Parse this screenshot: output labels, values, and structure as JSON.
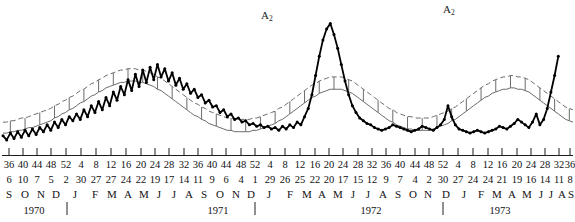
{
  "figure": {
    "title": "",
    "annotations": [
      {
        "name": "a2-peak-1",
        "text": "A",
        "sub": "2",
        "x": 261,
        "y": 10
      },
      {
        "name": "a2-peak-2",
        "text": "A",
        "sub": "2",
        "x": 443,
        "y": 4
      }
    ]
  },
  "chart_data": {
    "type": "line",
    "title": "",
    "xlabel": "",
    "ylabel": "",
    "grid": false,
    "legend": "none",
    "xlim": [
      0,
      157
    ],
    "ylim": [
      0,
      100
    ],
    "series": [
      {
        "name": "observed",
        "style": "solid-heavy-with-markers",
        "color": "#000000",
        "values": [
          14,
          11,
          16,
          12,
          17,
          13,
          18,
          14,
          19,
          15,
          20,
          17,
          22,
          18,
          24,
          20,
          26,
          22,
          28,
          25,
          30,
          26,
          33,
          28,
          36,
          31,
          39,
          33,
          42,
          36,
          46,
          40,
          50,
          44,
          55,
          47,
          59,
          50,
          62,
          53,
          64,
          55,
          66,
          57,
          63,
          54,
          60,
          51,
          56,
          48,
          52,
          45,
          48,
          42,
          44,
          38,
          40,
          35,
          36,
          31,
          33,
          28,
          30,
          26,
          27,
          24,
          25,
          22,
          23,
          21,
          22,
          20,
          21,
          19,
          20,
          18,
          21,
          19,
          22,
          20,
          24,
          22,
          28,
          34,
          44,
          58,
          72,
          84,
          92,
          96,
          88,
          78,
          66,
          54,
          44,
          36,
          31,
          27,
          25,
          23,
          22,
          20,
          19,
          18,
          19,
          20,
          22,
          21,
          20,
          19,
          18,
          17,
          18,
          19,
          21,
          20,
          19,
          18,
          20,
          22,
          26,
          36,
          28,
          22,
          19,
          18,
          17,
          16,
          17,
          18,
          17,
          16,
          17,
          18,
          19,
          21,
          20,
          19,
          21,
          23,
          26,
          24,
          22,
          20,
          24,
          30,
          22,
          26,
          34,
          46,
          58,
          72,
          88,
          70,
          62,
          66
        ]
      },
      {
        "name": "expected-upper",
        "style": "solid-thin",
        "color": "#6b6b6b",
        "values": [
          24,
          24,
          25,
          25,
          26,
          27,
          27,
          28,
          29,
          30,
          31,
          32,
          33,
          34,
          36,
          37,
          39,
          40,
          42,
          43,
          45,
          47,
          48,
          50,
          52,
          53,
          55,
          56,
          58,
          59,
          60,
          61,
          62,
          62,
          63,
          63,
          63,
          62,
          62,
          61,
          60,
          59,
          57,
          56,
          54,
          52,
          50,
          48,
          46,
          44,
          42,
          40,
          38,
          37,
          35,
          34,
          32,
          31,
          30,
          29,
          28,
          27,
          27,
          26,
          26,
          26,
          26,
          26,
          27,
          27,
          28,
          29,
          30,
          31,
          32,
          34,
          35,
          37,
          39,
          41,
          43,
          45,
          47,
          49,
          51,
          52,
          54,
          55,
          56,
          57,
          57,
          57,
          57,
          56,
          55,
          54,
          52,
          50,
          48,
          46,
          44,
          42,
          40,
          38,
          36,
          34,
          33,
          31,
          30,
          29,
          28,
          28,
          27,
          27,
          27,
          27,
          27,
          28,
          29,
          30,
          31,
          32,
          34,
          35,
          37,
          39,
          41,
          43,
          45,
          47,
          49,
          51,
          52,
          54,
          55,
          56,
          57,
          57,
          58,
          58,
          57,
          57,
          56,
          55,
          53,
          51,
          49,
          47,
          45,
          43,
          41,
          39,
          37,
          35,
          34,
          33
        ]
      },
      {
        "name": "expected-lower",
        "style": "solid-thin",
        "color": "#6b6b6b",
        "values": [
          16,
          16,
          17,
          17,
          18,
          18,
          19,
          20,
          20,
          21,
          22,
          23,
          24,
          25,
          27,
          28,
          30,
          31,
          33,
          34,
          36,
          38,
          39,
          41,
          43,
          44,
          46,
          47,
          49,
          50,
          51,
          52,
          53,
          53,
          54,
          54,
          54,
          53,
          53,
          52,
          51,
          50,
          48,
          47,
          45,
          43,
          41,
          39,
          37,
          35,
          33,
          31,
          29,
          28,
          26,
          25,
          23,
          22,
          21,
          20,
          19,
          18,
          18,
          17,
          17,
          17,
          17,
          17,
          18,
          18,
          19,
          20,
          21,
          22,
          23,
          25,
          26,
          28,
          30,
          32,
          34,
          36,
          38,
          40,
          42,
          43,
          45,
          46,
          47,
          48,
          48,
          48,
          48,
          47,
          46,
          45,
          43,
          41,
          39,
          37,
          35,
          33,
          31,
          29,
          27,
          25,
          24,
          22,
          21,
          20,
          19,
          19,
          18,
          18,
          18,
          18,
          18,
          19,
          20,
          21,
          22,
          23,
          25,
          26,
          28,
          30,
          32,
          34,
          36,
          38,
          40,
          42,
          43,
          45,
          46,
          47,
          48,
          48,
          49,
          49,
          48,
          48,
          47,
          46,
          44,
          42,
          40,
          38,
          36,
          34,
          32,
          30,
          28,
          26,
          25,
          24
        ]
      }
    ],
    "axis": {
      "week_numbers": [
        "36",
        "40",
        "44",
        "48",
        "52",
        "4",
        "8",
        "12",
        "16",
        "20",
        "24",
        "28",
        "32",
        "36",
        "40",
        "44",
        "48",
        "52",
        "4",
        "8",
        "12",
        "16",
        "20",
        "24",
        "28",
        "32",
        "36",
        "40",
        "44",
        "48",
        "52",
        "4",
        "8",
        "12",
        "16",
        "20",
        "24",
        "28",
        "32",
        "36",
        "40",
        "44",
        "48",
        "52",
        "4",
        "8",
        "12",
        "16",
        "20",
        "24",
        "28",
        "32",
        "36"
      ],
      "day_numbers": [
        "6",
        "10",
        "7",
        "5",
        "2",
        "30",
        "27",
        "27",
        "24",
        "22",
        "19",
        "17",
        "14",
        "11",
        "9",
        "6",
        "4",
        "1",
        "29",
        "26",
        "25",
        "22",
        "20",
        "17",
        "15",
        "12",
        "9",
        "7",
        "4",
        "2",
        "30",
        "27",
        "24",
        "24",
        "21",
        "19",
        "16",
        "14",
        "11",
        "8"
      ],
      "month_letters": [
        "S",
        "O",
        "N",
        "D",
        "J",
        "F",
        "M",
        "A",
        "M",
        "J",
        "J",
        "A",
        "S",
        "O",
        "N",
        "D",
        "J",
        "F",
        "M",
        "A",
        "M",
        "J",
        "J",
        "A",
        "S",
        "O",
        "N",
        "D",
        "J",
        "F",
        "M",
        "A",
        "M",
        "J",
        "J",
        "A",
        "S"
      ],
      "years": [
        "1970",
        "1971",
        "1972",
        "1973"
      ]
    }
  },
  "axis_labels": {
    "weeks": [
      {
        "v": "36",
        "x": 9
      },
      {
        "v": "40",
        "x": 23
      },
      {
        "v": "44",
        "x": 37
      },
      {
        "v": "48",
        "x": 51
      },
      {
        "v": "52",
        "x": 66
      },
      {
        "v": "4",
        "x": 81
      },
      {
        "v": "8",
        "x": 96
      },
      {
        "v": "12",
        "x": 111
      },
      {
        "v": "16",
        "x": 126
      },
      {
        "v": "20",
        "x": 141
      },
      {
        "v": "24",
        "x": 155
      },
      {
        "v": "28",
        "x": 169
      },
      {
        "v": "32",
        "x": 184
      },
      {
        "v": "36",
        "x": 198
      },
      {
        "v": "40",
        "x": 212
      },
      {
        "v": "44",
        "x": 226
      },
      {
        "v": "48",
        "x": 241
      },
      {
        "v": "52",
        "x": 255
      },
      {
        "v": "4",
        "x": 270
      },
      {
        "v": "8",
        "x": 285
      },
      {
        "v": "12",
        "x": 300
      },
      {
        "v": "16",
        "x": 315
      },
      {
        "v": "20",
        "x": 329
      },
      {
        "v": "24",
        "x": 343
      },
      {
        "v": "28",
        "x": 358
      },
      {
        "v": "32",
        "x": 372
      },
      {
        "v": "36",
        "x": 386
      },
      {
        "v": "40",
        "x": 400
      },
      {
        "v": "44",
        "x": 415
      },
      {
        "v": "48",
        "x": 429
      },
      {
        "v": "52",
        "x": 443
      },
      {
        "v": "4",
        "x": 458
      },
      {
        "v": "8",
        "x": 473
      },
      {
        "v": "12",
        "x": 488
      },
      {
        "v": "16",
        "x": 502
      },
      {
        "v": "20",
        "x": 517
      },
      {
        "v": "24",
        "x": 531
      },
      {
        "v": "28",
        "x": 545
      },
      {
        "v": "32",
        "x": 559
      },
      {
        "v": "36",
        "x": 570
      }
    ],
    "days": [
      {
        "v": "6",
        "x": 9
      },
      {
        "v": "10",
        "x": 23
      },
      {
        "v": "7",
        "x": 37
      },
      {
        "v": "5",
        "x": 51
      },
      {
        "v": "2",
        "x": 66
      },
      {
        "v": "30",
        "x": 81
      },
      {
        "v": "27",
        "x": 96
      },
      {
        "v": "27",
        "x": 111
      },
      {
        "v": "24",
        "x": 126
      },
      {
        "v": "22",
        "x": 141
      },
      {
        "v": "19",
        "x": 155
      },
      {
        "v": "17",
        "x": 169
      },
      {
        "v": "14",
        "x": 184
      },
      {
        "v": "11",
        "x": 198
      },
      {
        "v": "9",
        "x": 212
      },
      {
        "v": "6",
        "x": 226
      },
      {
        "v": "4",
        "x": 241
      },
      {
        "v": "1",
        "x": 255
      },
      {
        "v": "29",
        "x": 270
      },
      {
        "v": "26",
        "x": 285
      },
      {
        "v": "25",
        "x": 300
      },
      {
        "v": "22",
        "x": 315
      },
      {
        "v": "20",
        "x": 329
      },
      {
        "v": "17",
        "x": 343
      },
      {
        "v": "15",
        "x": 358
      },
      {
        "v": "12",
        "x": 372
      },
      {
        "v": "9",
        "x": 386
      },
      {
        "v": "7",
        "x": 400
      },
      {
        "v": "4",
        "x": 415
      },
      {
        "v": "2",
        "x": 429
      },
      {
        "v": "30",
        "x": 443
      },
      {
        "v": "27",
        "x": 458
      },
      {
        "v": "24",
        "x": 473
      },
      {
        "v": "24",
        "x": 488
      },
      {
        "v": "21",
        "x": 502
      },
      {
        "v": "19",
        "x": 517
      },
      {
        "v": "16",
        "x": 531
      },
      {
        "v": "14",
        "x": 545
      },
      {
        "v": "11",
        "x": 559
      },
      {
        "v": "8",
        "x": 570
      }
    ],
    "months": [
      {
        "v": "S",
        "x": 9
      },
      {
        "v": "O",
        "x": 25
      },
      {
        "v": "N",
        "x": 41
      },
      {
        "v": "D",
        "x": 56
      },
      {
        "v": "J",
        "x": 75
      },
      {
        "v": "F",
        "x": 95
      },
      {
        "v": "M",
        "x": 112
      },
      {
        "v": "A",
        "x": 128
      },
      {
        "v": "M",
        "x": 144
      },
      {
        "v": "J",
        "x": 159
      },
      {
        "v": "J",
        "x": 174
      },
      {
        "v": "A",
        "x": 189
      },
      {
        "v": "S",
        "x": 204
      },
      {
        "v": "O",
        "x": 220
      },
      {
        "v": "N",
        "x": 236
      },
      {
        "v": "D",
        "x": 251
      },
      {
        "v": "J",
        "x": 269
      },
      {
        "v": "F",
        "x": 290
      },
      {
        "v": "M",
        "x": 307
      },
      {
        "v": "A",
        "x": 322
      },
      {
        "v": "M",
        "x": 338
      },
      {
        "v": "J",
        "x": 353
      },
      {
        "v": "J",
        "x": 368
      },
      {
        "v": "A",
        "x": 383
      },
      {
        "v": "S",
        "x": 398
      },
      {
        "v": "O",
        "x": 413
      },
      {
        "v": "N",
        "x": 428
      },
      {
        "v": "D",
        "x": 446
      },
      {
        "v": "J",
        "x": 464
      },
      {
        "v": "F",
        "x": 481
      },
      {
        "v": "M",
        "x": 497
      },
      {
        "v": "A",
        "x": 512
      },
      {
        "v": "M",
        "x": 527
      },
      {
        "v": "J",
        "x": 541
      },
      {
        "v": "J",
        "x": 551
      },
      {
        "v": "A",
        "x": 562
      },
      {
        "v": "S",
        "x": 571
      }
    ],
    "years": [
      {
        "v": "1970",
        "x": 34
      },
      {
        "v": "1971",
        "x": 218
      },
      {
        "v": "1972",
        "x": 371
      },
      {
        "v": "1973",
        "x": 500
      }
    ],
    "year_dividers": [
      67,
      255,
      443
    ]
  }
}
